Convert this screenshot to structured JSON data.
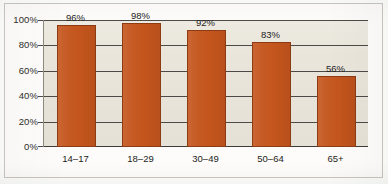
{
  "chart_data": {
    "type": "bar",
    "title": "",
    "subtitle": "",
    "xlabel": "",
    "ylabel": "",
    "categories": [
      "14–17",
      "18–29",
      "30–49",
      "50–64",
      "65+"
    ],
    "values": [
      96,
      98,
      92,
      83,
      56
    ],
    "value_labels": [
      "96%",
      "98%",
      "92%",
      "83%",
      "56%"
    ],
    "ylim": [
      0,
      100
    ],
    "ytick_values": [
      100,
      80,
      60,
      40,
      20,
      0
    ],
    "ytick_labels": [
      "100%",
      "80%",
      "60%",
      "40%",
      "20%",
      "0%"
    ],
    "grid": true,
    "legend": false,
    "legend_position": "none",
    "series": [
      {
        "name": "",
        "values": [
          96,
          98,
          92,
          83,
          56
        ]
      }
    ],
    "colors": {
      "bar_fill": "#c4551d",
      "bar_border": "#8d3b13",
      "plot_background": "#e9e5da",
      "gridline": "#4c4a46",
      "axis_line": "#3d3b38",
      "text": "#242220",
      "page_background": "#fdfcfa",
      "frame_border": "#c9c7c0"
    }
  },
  "axes": {
    "y_ticks": [
      {
        "label": "100%",
        "value": 100
      },
      {
        "label": "80%",
        "value": 80
      },
      {
        "label": "60%",
        "value": 60
      },
      {
        "label": "40%",
        "value": 40
      },
      {
        "label": "20%",
        "value": 20
      },
      {
        "label": "0%",
        "value": 0
      }
    ],
    "x_ticks": [
      {
        "label": "14–17"
      },
      {
        "label": "18–29"
      },
      {
        "label": "30–49"
      },
      {
        "label": "50–64"
      },
      {
        "label": "65+"
      }
    ]
  },
  "bars": [
    {
      "category": "14–17",
      "value": 96,
      "value_label": "96%"
    },
    {
      "category": "18–29",
      "value": 98,
      "value_label": "98%"
    },
    {
      "category": "30–49",
      "value": 92,
      "value_label": "92%"
    },
    {
      "category": "50–64",
      "value": 83,
      "value_label": "83%"
    },
    {
      "category": "65+",
      "value": 56,
      "value_label": "56%"
    }
  ]
}
